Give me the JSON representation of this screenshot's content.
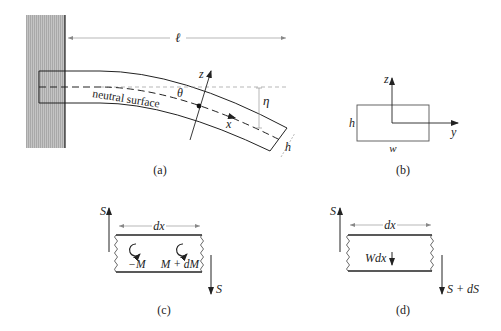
{
  "panels": {
    "a": {
      "caption": "(a)",
      "length_label": "ℓ",
      "neutral_surface_label": "neutral surface",
      "theta_label": "θ",
      "z_label": "z",
      "x_label": "x",
      "eta_label": "η",
      "h_label": "h"
    },
    "b": {
      "caption": "(b)",
      "z_label": "z",
      "y_label": "y",
      "h_label": "h",
      "w_label": "w"
    },
    "c": {
      "caption": "(c)",
      "shear_left_label": "S",
      "shear_right_label": "S",
      "dx_label": "dx",
      "moment_left_label": "−M",
      "moment_right_label": "M + dM"
    },
    "d": {
      "caption": "(d)",
      "shear_left_label": "S",
      "shear_right_label": "S + dS",
      "dx_label": "dx",
      "load_label": "Wdx"
    }
  },
  "colors": {
    "wall": "#b8b8b8",
    "line": "#222222",
    "thin": "#888888"
  }
}
